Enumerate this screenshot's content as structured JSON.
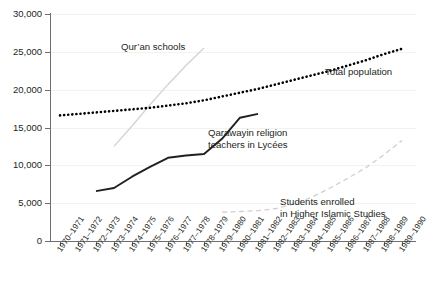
{
  "chart_data": {
    "type": "line",
    "title": "",
    "xlabel": "",
    "ylabel": "",
    "ylim": [
      0,
      30000
    ],
    "ytick_labels": [
      "0",
      "5,000",
      "10,000",
      "15,000",
      "20,000",
      "25,000",
      "30,000"
    ],
    "ytick_values": [
      0,
      5000,
      10000,
      15000,
      20000,
      25000,
      30000
    ],
    "grid": true,
    "legend_position": "inline-annotations",
    "categories": [
      "1970–1971",
      "1971–1972",
      "1972–1973",
      "1973–1974",
      "1974–1975",
      "1975–1976",
      "1976–1977",
      "1977–1978",
      "1978–1979",
      "1979–1980",
      "1980–1981",
      "1981–1982",
      "1982–1983",
      "1983–1984",
      "1984–1985",
      "1985–1986",
      "1986–1987",
      "1987–1988",
      "1988–1989",
      "1989–1990"
    ],
    "series": [
      {
        "name": "Total population",
        "style": "dotted",
        "color": "#000000",
        "x": [
          "1970–1971",
          "1971–1972",
          "1972–1973",
          "1973–1974",
          "1974–1975",
          "1975–1976",
          "1976–1977",
          "1977–1978",
          "1978–1979",
          "1979–1980",
          "1980–1981",
          "1981–1982",
          "1982–1983",
          "1983–1984",
          "1984–1985",
          "1985–1986",
          "1986–1987",
          "1987–1988",
          "1988–1989",
          "1989–1990"
        ],
        "values": [
          16600,
          16800,
          17000,
          17200,
          17400,
          17600,
          17900,
          18200,
          18600,
          19100,
          19600,
          20100,
          20700,
          21300,
          21900,
          22500,
          23200,
          23900,
          24700,
          25400
        ]
      },
      {
        "name": "Qur’an schools",
        "style": "solid-light",
        "color": "#d4d4d4",
        "x": [
          "1973–1974",
          "1974–1975",
          "1975–1976",
          "1976–1977",
          "1977–1978",
          "1978–1979"
        ],
        "values": [
          12500,
          15200,
          18000,
          20700,
          23200,
          25500
        ]
      },
      {
        "name": "Qarawayin religion teachers in Lycées",
        "style": "solid",
        "color": "#231f20",
        "x": [
          "1972–1973",
          "1973–1974",
          "1974–1975",
          "1975–1976",
          "1976–1977",
          "1977–1978",
          "1978–1979",
          "1979–1980",
          "1980–1981",
          "1981–1982"
        ],
        "values": [
          6600,
          7000,
          8500,
          9800,
          11000,
          11300,
          11500,
          13500,
          16300,
          16800
        ]
      },
      {
        "name": "Students enrolled in Higher Islamic Studies",
        "style": "dashed",
        "color": "#cfcfcf",
        "x": [
          "1979–1980",
          "1980–1981",
          "1981–1982",
          "1982–1983",
          "1983–1984",
          "1984–1985",
          "1985–1986",
          "1986–1987",
          "1987–1988",
          "1988–1989",
          "1989–1990"
        ],
        "values": [
          3800,
          3900,
          4000,
          4300,
          4900,
          5800,
          7000,
          8300,
          9700,
          11400,
          13300
        ]
      }
    ],
    "annotations": [
      {
        "id": "quran-schools",
        "text": "Qur’an schools"
      },
      {
        "id": "total-population",
        "text": "Total population"
      },
      {
        "id": "qarawayin-line1",
        "text": "Qarawayin religion"
      },
      {
        "id": "qarawayin-line2",
        "text": "teachers in Lycées"
      },
      {
        "id": "higher-islamic-line1",
        "text": "Students enrolled"
      },
      {
        "id": "higher-islamic-line2",
        "text": "in Higher Islamic Studies"
      }
    ]
  }
}
